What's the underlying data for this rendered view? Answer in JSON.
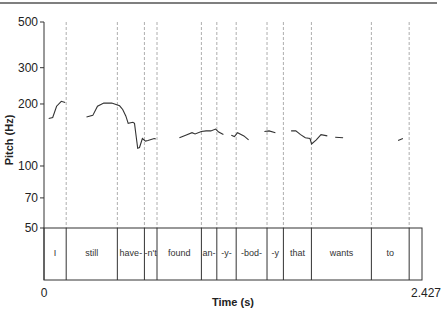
{
  "chart_data": {
    "type": "line",
    "title": "",
    "xlabel": "Time (s)",
    "ylabel": "Pitch (Hz)",
    "y_scale": "log",
    "ylim": [
      50,
      500
    ],
    "xlim": [
      0,
      2.427
    ],
    "y_ticks": [
      "500",
      "300",
      "200",
      "100",
      "70",
      "50"
    ],
    "x_ticks": [
      "0",
      "2.427"
    ],
    "grid": false,
    "legend": null,
    "segments": [
      {
        "label": "I",
        "start": 0.0,
        "end": 0.141
      },
      {
        "label": "still",
        "start": 0.141,
        "end": 0.466
      },
      {
        "label": "have-",
        "start": 0.466,
        "end": 0.638
      },
      {
        "label": "-n't",
        "start": 0.638,
        "end": 0.718
      },
      {
        "label": "found",
        "start": 0.718,
        "end": 1.0
      },
      {
        "label": "an-",
        "start": 1.0,
        "end": 1.098
      },
      {
        "label": "-y-",
        "start": 1.098,
        "end": 1.221
      },
      {
        "label": "-bod-",
        "start": 1.221,
        "end": 1.417
      },
      {
        "label": "-y",
        "start": 1.417,
        "end": 1.521
      },
      {
        "label": "that",
        "start": 1.521,
        "end": 1.699
      },
      {
        "label": "wants",
        "start": 1.699,
        "end": 2.08
      },
      {
        "label": "to",
        "start": 2.08,
        "end": 2.32
      }
    ],
    "series": [
      {
        "name": "pitch contour",
        "points": [
          [
            0.03,
            170
          ],
          [
            0.055,
            172
          ],
          [
            0.08,
            195
          ],
          [
            0.11,
            206
          ],
          [
            0.135,
            203
          ],
          [
            0.27,
            173
          ],
          [
            0.31,
            176
          ],
          [
            0.34,
            195
          ],
          [
            0.38,
            202
          ],
          [
            0.43,
            202
          ],
          [
            0.48,
            196
          ],
          [
            0.5,
            188
          ],
          [
            0.52,
            175
          ],
          [
            0.535,
            161
          ],
          [
            0.565,
            163
          ],
          [
            0.575,
            161
          ],
          [
            0.589,
            133
          ],
          [
            0.595,
            122
          ],
          [
            0.607,
            123
          ],
          [
            0.625,
            136
          ],
          [
            0.645,
            132
          ],
          [
            0.66,
            133
          ],
          [
            0.7,
            136
          ],
          [
            0.71,
            135
          ],
          [
            0.86,
            137
          ],
          [
            0.9,
            141
          ],
          [
            0.94,
            145
          ],
          [
            0.96,
            143
          ],
          [
            1.0,
            147
          ],
          [
            1.03,
            148
          ],
          [
            1.06,
            148
          ],
          [
            1.09,
            151
          ],
          [
            1.11,
            146
          ],
          [
            1.14,
            142
          ],
          [
            1.19,
            141
          ],
          [
            1.21,
            139
          ],
          [
            1.23,
            145
          ],
          [
            1.27,
            140
          ],
          [
            1.3,
            134
          ],
          [
            1.4,
            147
          ],
          [
            1.43,
            148
          ],
          [
            1.47,
            145
          ],
          [
            1.57,
            148
          ],
          [
            1.6,
            148
          ],
          [
            1.63,
            142
          ],
          [
            1.66,
            137
          ],
          [
            1.69,
            136
          ],
          [
            1.7,
            128
          ],
          [
            1.73,
            134
          ],
          [
            1.76,
            142
          ],
          [
            1.8,
            140
          ],
          [
            1.85,
            138
          ],
          [
            1.9,
            137
          ],
          [
            1.95,
            133
          ],
          [
            2.25,
            133
          ],
          [
            2.28,
            136
          ]
        ]
      }
    ]
  }
}
